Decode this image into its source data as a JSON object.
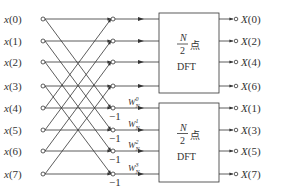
{
  "inputs": [
    "x(0)",
    "x(1)",
    "x(2)",
    "x(3)",
    "x(4)",
    "x(5)",
    "x(6)",
    "x(7)"
  ],
  "outputs_top": [
    "X(0)",
    "X(2)",
    "X(4)",
    "X(6)"
  ],
  "outputs_bottom": [
    "X(1)",
    "X(3)",
    "X(5)",
    "X(7)"
  ],
  "twiddles": [
    {
      "base": "W",
      "sub": "N",
      "sup": "0"
    },
    {
      "base": "W",
      "sub": "N",
      "sup": "1"
    },
    {
      "base": "W",
      "sub": "N",
      "sup": "2"
    },
    {
      "base": "W",
      "sub": "N",
      "sup": "3"
    }
  ],
  "minus_one": "−1",
  "dft_box_top": {
    "frac_num": "N",
    "frac_den": "2",
    "suffix": "点",
    "name": "DFT"
  },
  "dft_box_bottom": {
    "frac_num": "N",
    "frac_den": "2",
    "suffix": "点",
    "name": "DFT"
  },
  "colors": {
    "line": "#333333",
    "background": "#ffffff"
  }
}
